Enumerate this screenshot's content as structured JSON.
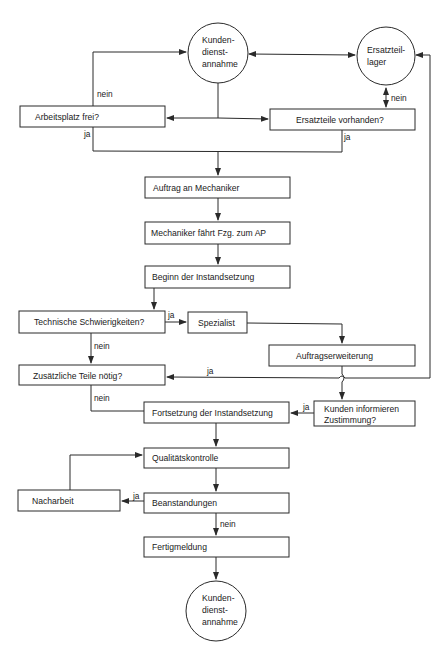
{
  "nodes": {
    "start": {
      "lines": [
        "Kunden-",
        "dienst-",
        "annahme"
      ]
    },
    "lager": {
      "lines": [
        "Ersatzteil-",
        "lager"
      ]
    },
    "arbeitsplatz": "Arbeitsplatz frei?",
    "ersatzteile": "Ersatzteile vorhanden?",
    "auftrag": "Auftrag an Mechaniker",
    "mechaniker": "Mechaniker fährt Fzg. zum AP",
    "beginn": "Beginn der Instandsetzung",
    "technisch": "Technische Schwierigkeiten?",
    "spezialist": "Spezialist",
    "erweiterung": "Auftragserweiterung",
    "zusaetzlich": "Zusätzliche Teile nötig?",
    "fortsetzung": "Fortsetzung der Instandsetzung",
    "kunden_info": {
      "lines": [
        "Kunden informieren",
        "Zustimmung?"
      ]
    },
    "qualitaet": "Qualitätskontrolle",
    "nacharbeit": "Nacharbeit",
    "beanstandungen": "Beanstandungen",
    "fertig": "Fertigmeldung",
    "end": {
      "lines": [
        "Kunden-",
        "dienst-",
        "annahme"
      ]
    }
  },
  "edge_labels": {
    "arbeitsplatz_nein": "nein",
    "arbeitsplatz_ja": "ja",
    "lager_nein": "nein",
    "ersatzteile_ja": "ja",
    "technisch_ja": "ja",
    "technisch_nein": "nein",
    "zusaetzlich_ja": "ja",
    "zusaetzlich_nein": "nein",
    "kunden_ja": "ja",
    "beanstandungen_ja": "ja",
    "beanstandungen_nein": "nein"
  },
  "colors": {
    "stroke": "#2a2a2a",
    "text": "#1a1a1a",
    "background": "#ffffff"
  }
}
